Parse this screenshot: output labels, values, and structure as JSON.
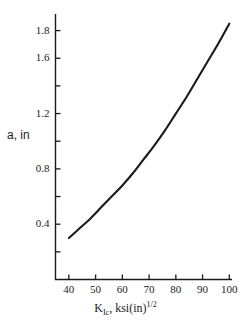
{
  "chart_data": {
    "type": "line",
    "title": "",
    "xlabel": "K_Ic, ksi(in)^1/2",
    "xlabel_parts": {
      "base": "K",
      "subscript": "Ic",
      "middle": ", ksi(in)",
      "superscript": "1/2"
    },
    "ylabel": "a, in",
    "xlim": [
      35,
      101
    ],
    "ylim": [
      0.0,
      1.92
    ],
    "grid": false,
    "legend": null,
    "xticks": [
      40,
      50,
      60,
      70,
      80,
      90,
      100
    ],
    "xtick_labels": [
      "40",
      "50",
      "60",
      "70",
      "80",
      "90",
      "100"
    ],
    "yticks": [
      0.2,
      0.4,
      0.6,
      0.8,
      1.0,
      1.2,
      1.4,
      1.6,
      1.8
    ],
    "ytick_labels": [
      "",
      "0.4",
      "",
      "0.8",
      "",
      "1.2",
      "",
      "1.6",
      "1.8"
    ],
    "series": [
      {
        "name": "a vs K_Ic",
        "color": "#1a1a1a",
        "x": [
          40,
          44,
          48,
          52,
          56,
          60,
          64,
          68,
          72,
          76,
          80,
          84,
          88,
          92,
          96,
          100
        ],
        "y": [
          0.3,
          0.37,
          0.44,
          0.52,
          0.6,
          0.68,
          0.77,
          0.87,
          0.97,
          1.08,
          1.2,
          1.32,
          1.45,
          1.58,
          1.71,
          1.85
        ]
      }
    ]
  },
  "axes": {
    "y_axis_name": "vertical-axis",
    "x_axis_name": "horizontal-axis"
  }
}
